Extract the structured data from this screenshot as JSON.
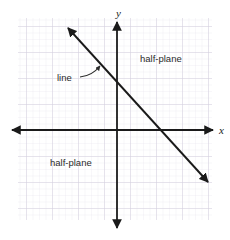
{
  "figure": {
    "background_color": "#ffffff",
    "grid": {
      "minor_color": "#e9e6ee",
      "major_color": "#d2cedb",
      "minor_spacing_px": 6.5,
      "major_spacing_px": 26,
      "left_px": 18,
      "top_px": 18,
      "right_px": 212,
      "bottom_px": 220
    },
    "axes": {
      "color": "#1a1a1a",
      "origin_px": {
        "x": 117,
        "y": 130
      },
      "x_axis": {
        "start_px": 12,
        "end_px": 213,
        "double_headed": true
      },
      "y_axis": {
        "start_px": 22,
        "end_px": 228,
        "double_headed": true
      },
      "x_label": "x",
      "y_label": "y",
      "x_label_pos_px": {
        "x": 220,
        "y": 133
      },
      "y_label_pos_px": {
        "x": 115,
        "y": 16
      }
    },
    "line": {
      "color": "#1a1a1a",
      "double_headed": true,
      "start_px": {
        "x": 68,
        "y": 28
      },
      "end_px": {
        "x": 208,
        "y": 182
      },
      "y_intercept_px": 88,
      "x_intercept_px": 186,
      "slope_px_per_px": -1.1
    },
    "annotations": [
      {
        "name": "line-callout",
        "text": "line",
        "pos_px": {
          "x": 57,
          "y": 80
        },
        "pointer_from_px": {
          "x": 80,
          "y": 76
        },
        "pointer_to_px": {
          "x": 100,
          "y": 64
        }
      },
      {
        "name": "half-plane-upper",
        "text": "half-plane",
        "pos_px": {
          "x": 140,
          "y": 61
        }
      },
      {
        "name": "half-plane-lower",
        "text": "half-plane",
        "pos_px": {
          "x": 50,
          "y": 165
        }
      }
    ]
  }
}
